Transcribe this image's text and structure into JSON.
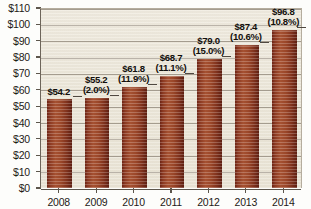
{
  "chart_data": {
    "type": "bar",
    "title": "",
    "subtitle": "",
    "xlabel": "",
    "ylabel": "",
    "categories": [
      "2008",
      "2009",
      "2010",
      "2011",
      "2012",
      "2013",
      "2014"
    ],
    "values": [
      54.2,
      55.2,
      61.8,
      68.7,
      79.0,
      87.4,
      96.8
    ],
    "value_labels": [
      "$54.2",
      "$55.2",
      "$61.8",
      "$68.7",
      "$79.0",
      "$87.4",
      "$96.8"
    ],
    "growth_labels": [
      "",
      "(2.0%)",
      "(11.9%)",
      "(11.1%)",
      "(15.0%)",
      "(10.6%)",
      "(10.8%)"
    ],
    "ylim": [
      0,
      110
    ],
    "ytick_values": [
      0,
      10,
      20,
      30,
      40,
      50,
      60,
      70,
      80,
      90,
      100,
      110
    ],
    "ytick_labels": [
      "$0",
      "$10",
      "$20",
      "$30",
      "$40",
      "$50",
      "$60",
      "$70",
      "$80",
      "$90",
      "$100",
      "$110"
    ],
    "grid": true,
    "legend": false,
    "legend_position": "none",
    "series": [
      {
        "name": "Value",
        "values": [
          54.2,
          55.2,
          61.8,
          68.7,
          79.0,
          87.4,
          96.8
        ]
      }
    ],
    "colors": {
      "bar_fill": "#9c4729",
      "bar_edge_dark": "#6e2414",
      "plot_background": "#ece7d9",
      "gridline": "#9a9184",
      "axis": "#5d564c",
      "text": "#1d1a16",
      "page_background": "#fdfdfb"
    }
  }
}
